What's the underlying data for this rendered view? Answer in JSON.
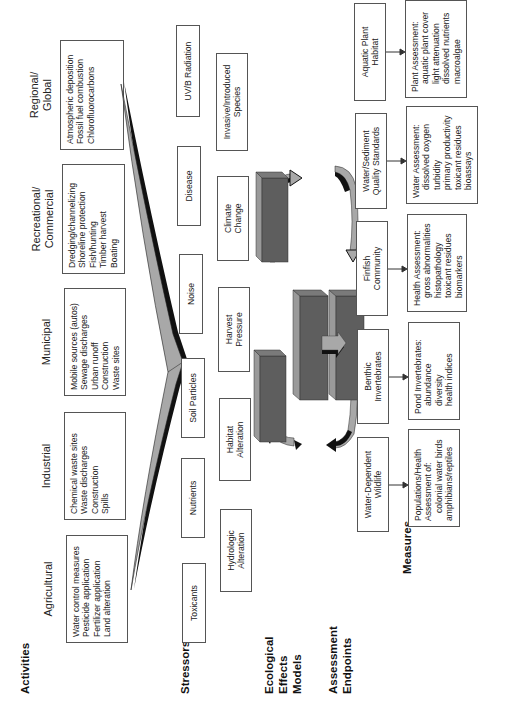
{
  "sections": {
    "activities": "Activities",
    "stressors": "Stressors",
    "models": [
      "Ecological",
      "Effects",
      "Models"
    ],
    "endpoints": [
      "Assessment",
      "Endpoints"
    ],
    "measures": "Measures"
  },
  "activities": [
    {
      "title": [
        "Agricultural"
      ],
      "items": [
        "Water control measures",
        "Pesticide application",
        "Fertilizer application",
        "Land alteration"
      ]
    },
    {
      "title": [
        "Industrial"
      ],
      "items": [
        "Chemical waste sites",
        "Waste discharges",
        "Construction",
        "Spills"
      ]
    },
    {
      "title": [
        "Municipal"
      ],
      "items": [
        "Mobile sources (autos)",
        "Sewage discharges",
        "Urban runoff",
        "Construction",
        "Waste sites"
      ]
    },
    {
      "title": [
        "Recreational/",
        "Commercial"
      ],
      "items": [
        "Dredging/channelizing",
        "Shoreline protection",
        "Fish/hunting",
        "Timber harvest",
        "Boating"
      ]
    },
    {
      "title": [
        "Regional/",
        "Global"
      ],
      "items": [
        "Atmospheric deposition",
        "Fossil fuel combustion",
        "Chlorofluorocarbons"
      ]
    }
  ],
  "stressors_row1": [
    "Toxicants",
    "Nutrients",
    "Soil Particles",
    "Noise",
    "Disease",
    "UV/B Radiation"
  ],
  "stressors_row2": [
    [
      "Hydrologic",
      "Alteration"
    ],
    [
      "Habitat",
      "Alteration"
    ],
    [
      "Harvest",
      "Pressure"
    ],
    [
      "Climate",
      "Change"
    ],
    [
      "Invasive/Introduced",
      "Species"
    ]
  ],
  "endpoints": [
    [
      "Water-Dependent",
      "Wildlife"
    ],
    [
      "Benthic",
      "Invertebrates"
    ],
    [
      "Finfish",
      "Community"
    ],
    [
      "Water/Sediment",
      "Quality Standards"
    ],
    [
      "Aquatic Plant",
      "Habitat"
    ]
  ],
  "measures": [
    {
      "lines": [
        "Populations/Health",
        "Assessment of:"
      ],
      "items": [
        "colonial water birds",
        "amphibians/reptiles"
      ]
    },
    {
      "lines": [
        "Pond Invertebrates:"
      ],
      "items": [
        "abundance",
        "diversity",
        "health indices"
      ]
    },
    {
      "lines": [
        "Health Assessment:"
      ],
      "items": [
        "gross abnormalities",
        "histopathology",
        "toxicant residues",
        "biomarkers"
      ]
    },
    {
      "lines": [
        "Water Assessment:"
      ],
      "items": [
        "dissolved oxygen",
        "turbidity",
        "primary productivity",
        "toxicant residues",
        "bioassays"
      ]
    },
    {
      "lines": [
        "Plant Assessment:"
      ],
      "items": [
        "aquatic plant cover",
        "light attenuation",
        "dissolved nutrients",
        "macroalgae"
      ]
    }
  ],
  "colors": {
    "box_border": "#555555",
    "arrow_fill": "#a8a8a8",
    "arrow_shadow": "#111111",
    "block_front": "#5e5e5e",
    "block_top": "#9a9a9a",
    "block_side": "#7a7a7a"
  }
}
